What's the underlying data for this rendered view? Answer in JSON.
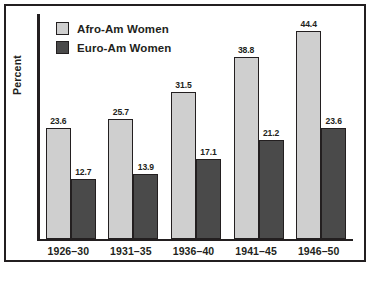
{
  "chart_data": {
    "type": "bar",
    "title": "",
    "subtitle": "",
    "xlabel": "",
    "ylabel": "Percent",
    "categories": [
      "1926–30",
      "1931–35",
      "1936–40",
      "1941–45",
      "1946–50"
    ],
    "series": [
      {
        "name": "Afro-Am Women",
        "color": "#cfcfcf",
        "values": [
          23.6,
          25.7,
          31.5,
          38.8,
          44.4
        ],
        "labels": [
          "23.6",
          "25.7",
          "31.5",
          "38.8",
          "44.4"
        ]
      },
      {
        "name": "Euro-Am Women",
        "color": "#4a4a4a",
        "values": [
          12.7,
          13.9,
          17.1,
          21.2,
          23.6
        ],
        "labels": [
          "12.7",
          "13.9",
          "17.1",
          "21.2",
          "23.6"
        ]
      }
    ],
    "ylim": [
      0,
      48
    ],
    "grid": false,
    "y_tick_labels": [],
    "legend_position": "top-left-inside",
    "data_labels": true
  },
  "legend": {
    "items": [
      {
        "label": "Afro-Am Women",
        "swatch": "light"
      },
      {
        "label": "Euro-Am Women",
        "swatch": "dark"
      }
    ]
  },
  "axes": {
    "y_title": "Percent"
  },
  "colors": {
    "series_light": "#cfcfcf",
    "series_dark": "#4a4a4a",
    "outline": "#231f20",
    "background": "#ffffff"
  }
}
